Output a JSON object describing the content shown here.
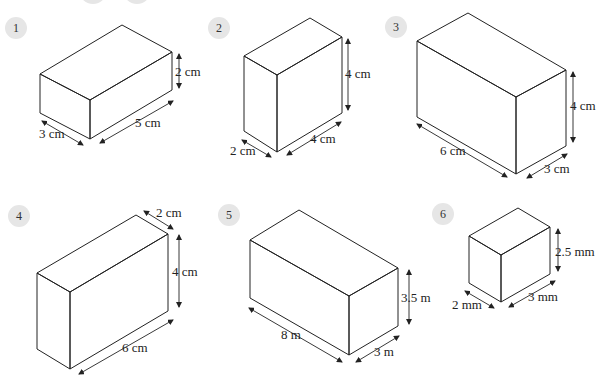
{
  "figures": [
    {
      "number": "1",
      "fill": "#ffffff",
      "labels": {
        "height": "2 cm",
        "length": "5 cm",
        "width": "3 cm"
      }
    },
    {
      "number": "2",
      "fill": "#f2f2f2",
      "labels": {
        "height": "4 cm",
        "length": "4 cm",
        "width": "2 cm"
      }
    },
    {
      "number": "3",
      "fill": "#555555",
      "labels": {
        "height": "4 cm",
        "length": "6 cm",
        "width": "3 cm"
      }
    },
    {
      "number": "4",
      "fill": "#eeeeee",
      "labels": {
        "height": "4 cm",
        "length": "6 cm",
        "width": "2 cm"
      }
    },
    {
      "number": "5",
      "fill": "#a9a9a9",
      "labels": {
        "height": "3.5 m",
        "length": "8 m",
        "width": "3 m"
      }
    },
    {
      "number": "6",
      "fill": "#ffffff",
      "labels": {
        "height": "2.5 mm",
        "length": "3 mm",
        "width": "2 mm"
      }
    }
  ]
}
